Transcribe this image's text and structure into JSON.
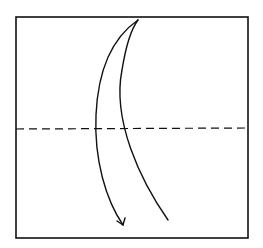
{
  "diagram": {
    "type": "origami-fold-step",
    "paper": {
      "shape": "square",
      "x": 16,
      "y": 17,
      "width": 232,
      "height": 221,
      "stroke": "#111111"
    },
    "fold_line": {
      "style": "dashed",
      "kind": "valley-fold",
      "orientation": "horizontal",
      "y": 129,
      "color": "#111111"
    },
    "arrow": {
      "direction": "fold-down",
      "color": "#111111"
    },
    "labels": []
  }
}
